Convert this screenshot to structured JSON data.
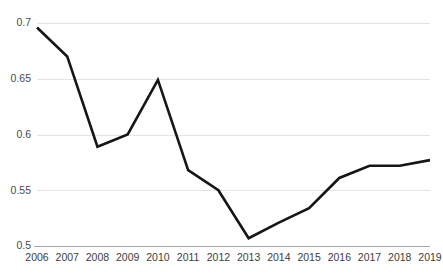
{
  "chart_data": {
    "type": "line",
    "title": "",
    "subtitle": "",
    "xlabel": "",
    "ylabel": "",
    "categories": [
      "2006",
      "2007",
      "2008",
      "2009",
      "2010",
      "2011",
      "2012",
      "2013",
      "2014",
      "2015",
      "2016",
      "2017",
      "2018",
      "2019"
    ],
    "x": [
      2006,
      2007,
      2008,
      2009,
      2010,
      2011,
      2012,
      2013,
      2014,
      2015,
      2016,
      2017,
      2018,
      2019
    ],
    "values": [
      0.696,
      0.67,
      0.589,
      0.6,
      0.649,
      0.568,
      0.55,
      0.507,
      0.521,
      0.534,
      0.561,
      0.572,
      0.572,
      0.577
    ],
    "series": [
      {
        "name": "",
        "values": [
          0.696,
          0.67,
          0.589,
          0.6,
          0.649,
          0.568,
          0.55,
          0.507,
          0.521,
          0.534,
          0.561,
          0.572,
          0.572,
          0.577
        ]
      }
    ],
    "ylim": [
      0.5,
      0.7
    ],
    "yticks": [
      0.5,
      0.55,
      0.6,
      0.65,
      0.7
    ],
    "ytick_labels": [
      "0.5",
      "0.55",
      "0.6",
      "0.65",
      "0.7"
    ],
    "xtick_labels": [
      "2006",
      "2007",
      "2008",
      "2009",
      "2010",
      "2011",
      "2012",
      "2013",
      "2014",
      "2015",
      "2016",
      "2017",
      "2018",
      "2019"
    ],
    "grid": true,
    "grid_axis": "y",
    "legend": false,
    "legend_position": "none",
    "markers": false,
    "annotations": []
  },
  "style": {
    "line_color": "#161616",
    "line_width": 2.6,
    "grid_color": "#e4e4e4",
    "axis_color": "#a6a6a6",
    "tick_text_color": "#3d3d3d",
    "background": "#ffffff"
  },
  "layout": {
    "plot_left": 37,
    "plot_right": 430,
    "plot_top": 23,
    "plot_bottom": 246,
    "xlabel_baseline": 253
  }
}
